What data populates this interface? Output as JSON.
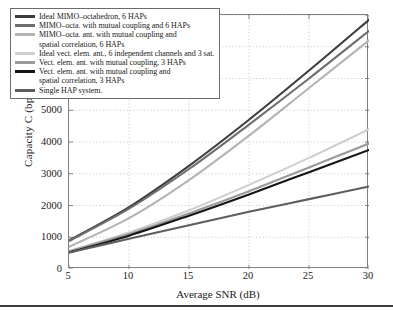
{
  "axes": {
    "ylabel": "Capacity C (bps)",
    "xlabel": "Average SNR (dB)",
    "yticks": [
      "0",
      "1000",
      "2000",
      "3000",
      "4000",
      "5000",
      "6000",
      "7000",
      "8000"
    ],
    "xticks": [
      "5",
      "10",
      "15",
      "20",
      "25",
      "30"
    ]
  },
  "legend": {
    "entries": [
      {
        "label": "Ideal MIMO–octahedron, 6 HAPs",
        "color": "#3d3d3d",
        "continuation": false
      },
      {
        "label": "MIMO–octa. with mutual coupling and 6 HAPs",
        "color": "#6e6e6e",
        "continuation": false
      },
      {
        "label": "MIMO–octa. ant. with mutual coupling and",
        "color": "#b4b4b4",
        "continuation": false
      },
      {
        "label": "spatial correlation, 6 HAPs",
        "color": "#b4b4b4",
        "continuation": true
      },
      {
        "label": "Ideal vect. elem. ant., 6 independent channels and 3 sat.",
        "color": "#cfcfcf",
        "continuation": false
      },
      {
        "label": "Vect. elem. ant. with mutual coupling, 3 HAPs",
        "color": "#9a9a9a",
        "continuation": false
      },
      {
        "label": "Vect. elem. ant. with mutual coupling and",
        "color": "#151515",
        "continuation": false
      },
      {
        "label": "spatial correlation, 3 HAPs",
        "color": "#151515",
        "continuation": true
      },
      {
        "label": "Single HAP system.",
        "color": "#5e5e5e",
        "continuation": false
      }
    ]
  },
  "chart_data": {
    "type": "line",
    "title": "",
    "xlabel": "Average SNR (dB)",
    "ylabel": "Capacity C (bps)",
    "xlim": [
      5,
      30
    ],
    "ylim": [
      0,
      8000
    ],
    "grid": true,
    "legend_position": "top-left",
    "x": [
      5,
      10,
      15,
      20,
      25,
      30
    ],
    "series": [
      {
        "name": "Ideal MIMO–octahedron, 6 HAPs",
        "color": "#3d3d3d",
        "values": [
          900,
          1950,
          3250,
          4700,
          6250,
          7850
        ]
      },
      {
        "name": "MIMO–octa. with mutual coupling and 6 HAPs",
        "color": "#6e6e6e",
        "values": [
          880,
          1900,
          3150,
          4550,
          6000,
          7500
        ]
      },
      {
        "name": "MIMO–octa. ant. with mutual coupling and spatial correlation, 6 HAPs",
        "color": "#b4b4b4",
        "values": [
          700,
          1600,
          2800,
          4200,
          5700,
          7200
        ]
      },
      {
        "name": "Ideal vect. elem. ant., 6 independent channels and 3 sat.",
        "color": "#cfcfcf",
        "values": [
          560,
          1150,
          1850,
          2650,
          3500,
          4400
        ]
      },
      {
        "name": "Vect. elem. ant. with mutual coupling, 3 HAPs",
        "color": "#9a9a9a",
        "values": [
          560,
          1100,
          1750,
          2450,
          3200,
          3950
        ]
      },
      {
        "name": "Vect. elem. ant. with mutual coupling and spatial correlation, 3 HAPs",
        "color": "#151515",
        "values": [
          520,
          1050,
          1680,
          2350,
          3050,
          3750
        ]
      },
      {
        "name": "Single HAP system.",
        "color": "#5e5e5e",
        "values": [
          520,
          950,
          1380,
          1800,
          2200,
          2600
        ]
      }
    ]
  }
}
